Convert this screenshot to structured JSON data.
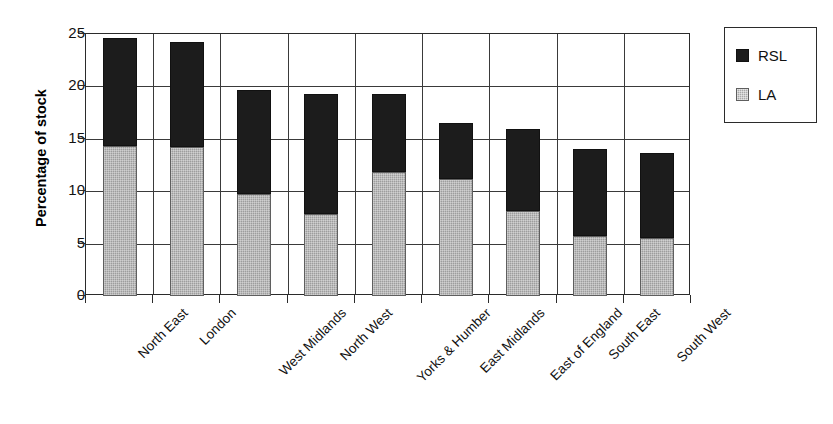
{
  "chart_data": {
    "type": "bar",
    "subtype": "stacked-vertical",
    "title": "",
    "xlabel": "",
    "ylabel": "Percentage of stock",
    "ylim": [
      0,
      25
    ],
    "yticks": [
      0,
      5,
      10,
      15,
      20,
      25
    ],
    "ytick_labels": [
      "0",
      "5",
      "10",
      "15",
      "20",
      "25"
    ],
    "grid": "horizontal-and-vertical",
    "legend_position": "right",
    "categories": [
      "North East",
      "London",
      "West Midlands",
      "North West",
      "Yorks & Humber",
      "East Midlands",
      "East of England",
      "South East",
      "South West"
    ],
    "series": [
      {
        "name": "LA",
        "color": "#9d9d9d",
        "values": [
          14.3,
          14.2,
          9.7,
          7.8,
          11.8,
          11.2,
          8.1,
          5.7,
          5.5
        ]
      },
      {
        "name": "RSL",
        "color": "#1c1c1c",
        "values": [
          10.3,
          10.0,
          10.0,
          11.5,
          7.5,
          5.3,
          7.8,
          8.3,
          8.1
        ]
      }
    ],
    "totals": [
      24.6,
      24.2,
      19.7,
      19.3,
      19.3,
      16.5,
      15.9,
      14.0,
      13.6
    ]
  },
  "legend": {
    "entries": [
      {
        "label": "RSL",
        "swatch": "rsl-swatch"
      },
      {
        "label": "LA",
        "swatch": "la-swatch"
      }
    ]
  },
  "colors": {
    "rsl": "#1c1c1c",
    "la": "#9d9d9d",
    "axis": "#2b2b2b",
    "background": "#ffffff"
  }
}
